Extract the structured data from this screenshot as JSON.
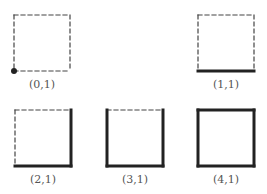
{
  "figures": [
    {
      "label": "(0,1)",
      "x": 14,
      "y": 15,
      "solid_edges": [],
      "corner_dot": true
    },
    {
      "label": "(1,1)",
      "x": 198,
      "y": 15,
      "solid_edges": [
        "bottom"
      ],
      "corner_dot": false
    },
    {
      "label": "(2,1)",
      "x": 15,
      "y": 110,
      "solid_edges": [
        "bottom",
        "right"
      ],
      "corner_dot": false
    },
    {
      "label": "(3,1)",
      "x": 107,
      "y": 110,
      "solid_edges": [
        "bottom",
        "right",
        "left"
      ],
      "corner_dot": false
    },
    {
      "label": "(4,1)",
      "x": 198,
      "y": 110,
      "solid_edges": [
        "bottom",
        "right",
        "left",
        "top"
      ],
      "corner_dot": false
    }
  ],
  "colors": {
    "stroke": "#222222",
    "label": "#555555"
  },
  "square_size": 56
}
